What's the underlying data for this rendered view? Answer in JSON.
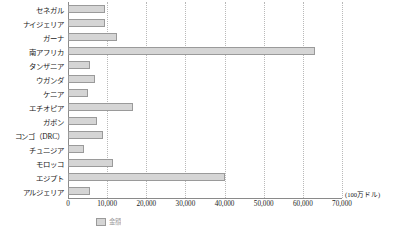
{
  "chart_data": {
    "type": "bar",
    "orientation": "horizontal",
    "title": "",
    "xlabel": "",
    "ylabel": "",
    "unit_label": "(100万ドル)",
    "xlim": [
      0,
      70000
    ],
    "xticks": [
      0,
      10000,
      20000,
      30000,
      40000,
      50000,
      60000,
      70000
    ],
    "xticklabels": [
      "0",
      "10,000",
      "20,000",
      "30,000",
      "40,000",
      "50,000",
      "60,000",
      "70,000"
    ],
    "grid": true,
    "grid_axis": "x",
    "legend": false,
    "categories": [
      "セネガル",
      "ナイジェリア",
      "ガーナ",
      "南アフリカ",
      "タンザニア",
      "ウガンダ",
      "ケニア",
      "エチオピア",
      "ガボン",
      "コンゴ（DRC）",
      "チュニジア",
      "モロッコ",
      "エジプト",
      "アルジェリア"
    ],
    "values": [
      9500,
      9500,
      12500,
      63000,
      5500,
      7000,
      5200,
      16500,
      7500,
      9000,
      4000,
      11500,
      40000,
      5500
    ],
    "series": [
      {
        "name": "金額",
        "values": [
          9500,
          9500,
          12500,
          63000,
          5500,
          7000,
          5200,
          16500,
          7500,
          9000,
          4000,
          11500,
          40000,
          5500
        ]
      }
    ],
    "bar_color": "#d5d5d5",
    "bar_edge_color": "#9a9a9a"
  },
  "caption": {
    "legend_label": "金額"
  }
}
